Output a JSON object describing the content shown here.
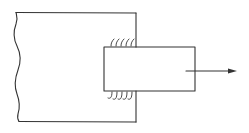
{
  "diagram": {
    "type": "mechanical-schematic",
    "colors": {
      "line": "#333333",
      "background": "#ffffff"
    },
    "elements": [
      {
        "id": "large-block",
        "shape": "rectangle-with-break-line",
        "bounds": [
          16,
          12,
          136,
          122
        ]
      },
      {
        "id": "small-bar",
        "shape": "rectangle",
        "bounds": [
          104,
          47,
          195,
          91
        ]
      },
      {
        "id": "hatch-top",
        "shape": "curved-ticks",
        "count": 5,
        "location": "top interface"
      },
      {
        "id": "hatch-bottom",
        "shape": "curved-ticks",
        "count": 5,
        "location": "bottom interface"
      },
      {
        "id": "pull-arrow",
        "shape": "arrow",
        "direction": "right",
        "from": [
          186,
          71
        ],
        "to": [
          237,
          71
        ]
      }
    ],
    "labels": []
  }
}
